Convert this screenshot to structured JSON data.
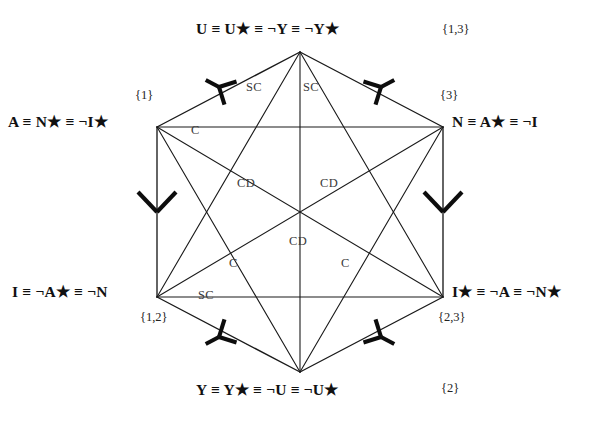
{
  "diagram": {
    "type": "logical-hexagon",
    "title": "",
    "line_color": "#1a1a1a",
    "label_color": "#111111",
    "edge_label_color": "#3a3a3a",
    "background": "#ffffff",
    "vertices": [
      {
        "id": "top",
        "label": "U ≡ U★ ≡ ¬Y ≡ ¬Y★",
        "set": "{1,3}",
        "x": 300,
        "y": 52
      },
      {
        "id": "upperleft",
        "label": "A ≡ N★ ≡ ¬I★",
        "set": "{1}",
        "x": 157,
        "y": 127
      },
      {
        "id": "upperright",
        "label": "N ≡ A★ ≡ ¬I",
        "set": "{3}",
        "x": 443,
        "y": 127
      },
      {
        "id": "lowerleft",
        "label": "I ≡ ¬A★ ≡ ¬N",
        "set": "{1,2}",
        "x": 157,
        "y": 297
      },
      {
        "id": "lowerright",
        "label": "I★ ≡ ¬A ≡ ¬N★",
        "set": "{2,3}",
        "x": 443,
        "y": 297
      },
      {
        "id": "bottom",
        "label": "Y ≡ Y★ ≡ ¬U ≡ ¬U★",
        "set": "{2}",
        "x": 300,
        "y": 372
      }
    ],
    "edge_labels": [
      {
        "id": "sc-top-left",
        "text": "SC",
        "x": 255,
        "y": 88
      },
      {
        "id": "sc-top-right",
        "text": "SC",
        "x": 312,
        "y": 88
      },
      {
        "id": "c-upper-left",
        "text": "C",
        "x": 200,
        "y": 131
      },
      {
        "id": "cd-mid-left",
        "text": "CD",
        "x": 246,
        "y": 184
      },
      {
        "id": "cd-mid-right",
        "text": "CD",
        "x": 329,
        "y": 184
      },
      {
        "id": "cd-center",
        "text": "CD",
        "x": 298,
        "y": 242
      },
      {
        "id": "c-lower-left",
        "text": "C",
        "x": 238,
        "y": 264
      },
      {
        "id": "c-lower-right",
        "text": "C",
        "x": 350,
        "y": 264
      },
      {
        "id": "sc-bottom-left",
        "text": "SC",
        "x": 207,
        "y": 296
      }
    ],
    "arrowheads": [
      {
        "id": "arrow-top-left-edge",
        "style": "y-fork",
        "direction": "up-left"
      },
      {
        "id": "arrow-top-right-edge",
        "style": "y-fork",
        "direction": "up-right"
      },
      {
        "id": "arrow-left-vertical",
        "style": "chevron",
        "direction": "down"
      },
      {
        "id": "arrow-right-vertical",
        "style": "chevron",
        "direction": "down"
      },
      {
        "id": "arrow-bottom-left-edge",
        "style": "y-fork",
        "direction": "down-left"
      },
      {
        "id": "arrow-bottom-right-edge",
        "style": "y-fork",
        "direction": "down-right"
      }
    ]
  }
}
